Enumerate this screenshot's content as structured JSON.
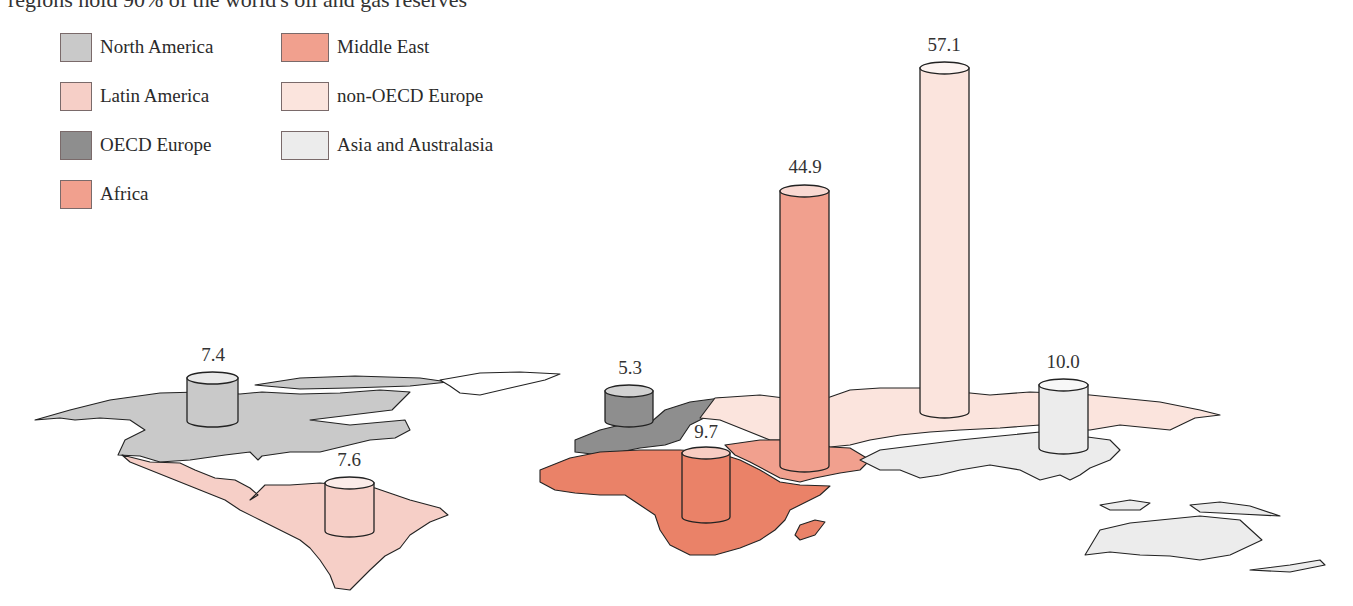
{
  "caption": "regions hold 90% of the world's oil and gas reserves",
  "legend": [
    {
      "label": "North America",
      "color": "#c9c9c9"
    },
    {
      "label": "Latin America",
      "color": "#f6cfc7"
    },
    {
      "label": "OECD Europe",
      "color": "#8e8e8e"
    },
    {
      "label": "Africa",
      "color": "#f1a08e"
    },
    {
      "label": "Middle East",
      "color": "#f1a08e"
    },
    {
      "label": "non-OECD Europe",
      "color": "#fbe4dd"
    },
    {
      "label": "Asia and Australasia",
      "color": "#ececec"
    }
  ],
  "region_colors": {
    "north_america": "#c9c9c9",
    "latin_america": "#f6cfc7",
    "oecd_europe": "#8e8e8e",
    "africa": "#ea8268",
    "middle_east": "#f1a08e",
    "non_oecd_europe": "#fbe4dd",
    "asia_australasia": "#ececec"
  },
  "chart_data": {
    "type": "bar",
    "subtype": "3d-cylinders-on-world-map",
    "title": "regions hold 90% of the world's oil and gas reserves",
    "categories": [
      "North America",
      "Latin America",
      "OECD Europe",
      "Africa",
      "Middle East",
      "non-OECD Europe",
      "Asia and Australasia"
    ],
    "values": [
      7.4,
      7.6,
      5.3,
      9.7,
      44.9,
      57.1,
      10.0
    ],
    "data_labels": [
      "7.4",
      "7.6",
      "5.3",
      "9.7",
      "44.9",
      "57.1",
      "10.0"
    ],
    "xlabel": "",
    "ylabel": "",
    "grid": false,
    "legend_position": "top-left"
  },
  "cylinders": [
    {
      "region": "North America",
      "label": "7.4",
      "x": 187,
      "top": 378,
      "bottom": 421,
      "w": 51,
      "color": "#c9c9c9",
      "lx": 213,
      "ly": 361
    },
    {
      "region": "Latin America",
      "label": "7.6",
      "x": 325,
      "top": 483,
      "bottom": 531,
      "w": 49,
      "color": "#f6cfc7",
      "lx": 349,
      "ly": 466
    },
    {
      "region": "OECD Europe",
      "label": "5.3",
      "x": 605,
      "top": 391,
      "bottom": 421,
      "w": 48,
      "color": "#8e8e8e",
      "lx": 630,
      "ly": 374
    },
    {
      "region": "Africa",
      "label": "9.7",
      "x": 682,
      "top": 453,
      "bottom": 517,
      "w": 48,
      "color": "#ea8268",
      "lx": 706,
      "ly": 438
    },
    {
      "region": "Middle East",
      "label": "44.9",
      "x": 780,
      "top": 191,
      "bottom": 466,
      "w": 49,
      "color": "#f1a08e",
      "lx": 805,
      "ly": 173
    },
    {
      "region": "non-OECD Europe",
      "label": "57.1",
      "x": 920,
      "top": 68,
      "bottom": 412,
      "w": 49,
      "color": "#fbe4dd",
      "lx": 944,
      "ly": 51
    },
    {
      "region": "Asia and Australasia",
      "label": "10.0",
      "x": 1039,
      "top": 385,
      "bottom": 448,
      "w": 49,
      "color": "#ececec",
      "lx": 1063,
      "ly": 368
    }
  ]
}
